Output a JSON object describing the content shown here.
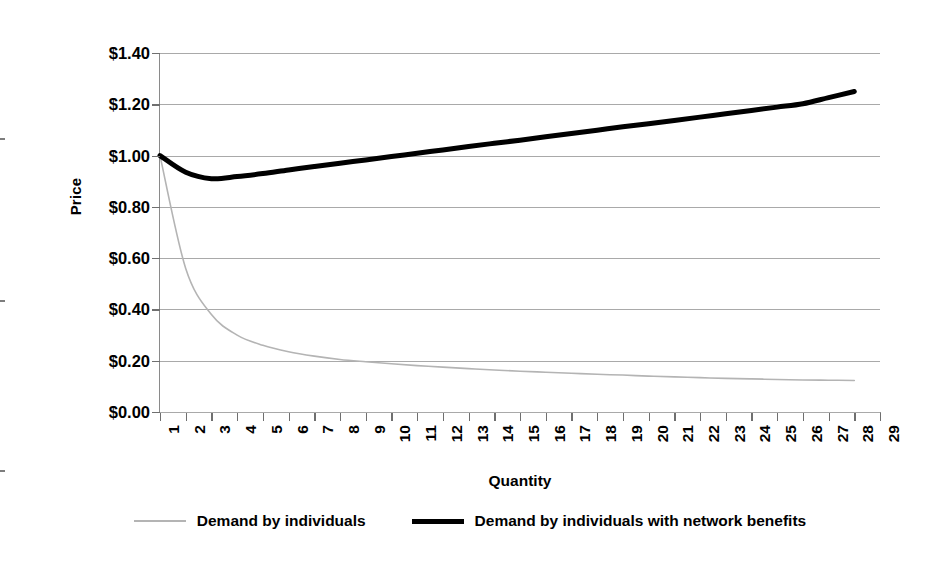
{
  "chart_data": {
    "type": "line",
    "title": "",
    "xlabel": "Quantity",
    "ylabel": "Price",
    "grid": true,
    "legend_position": "bottom",
    "xlim": [
      1,
      29
    ],
    "ylim": [
      0.0,
      1.4
    ],
    "y_ticks": [
      "$1.40",
      "$1.20",
      "$1.00",
      "$0.80",
      "$0.60",
      "$0.40",
      "$0.20",
      "$0.00"
    ],
    "y_tick_values": [
      1.4,
      1.2,
      1.0,
      0.8,
      0.6,
      0.4,
      0.2,
      0.0
    ],
    "x_ticks": [
      "1",
      "2",
      "3",
      "4",
      "5",
      "6",
      "7",
      "8",
      "9",
      "10",
      "11",
      "12",
      "13",
      "14",
      "15",
      "16",
      "17",
      "18",
      "19",
      "20",
      "21",
      "22",
      "23",
      "24",
      "25",
      "26",
      "27",
      "28",
      "29"
    ],
    "x": [
      1,
      2,
      3,
      4,
      5,
      6,
      7,
      8,
      9,
      10,
      11,
      12,
      13,
      14,
      15,
      16,
      17,
      18,
      19,
      20,
      21,
      22,
      23,
      24,
      25,
      26,
      27,
      28
    ],
    "series": [
      {
        "name": "Demand by individuals",
        "color": "#b4b4b4",
        "width": 1.6,
        "values": [
          1.0,
          0.56,
          0.38,
          0.3,
          0.26,
          0.235,
          0.218,
          0.205,
          0.196,
          0.188,
          0.181,
          0.175,
          0.169,
          0.164,
          0.159,
          0.155,
          0.151,
          0.147,
          0.144,
          0.14,
          0.137,
          0.134,
          0.131,
          0.129,
          0.127,
          0.125,
          0.124,
          0.123
        ]
      },
      {
        "name": "Demand by individuals with network benefits",
        "color": "#000000",
        "width": 5.0,
        "values": [
          1.0,
          0.935,
          0.91,
          0.918,
          0.93,
          0.944,
          0.957,
          0.97,
          0.983,
          0.996,
          1.009,
          1.022,
          1.035,
          1.048,
          1.06,
          1.073,
          1.086,
          1.099,
          1.112,
          1.124,
          1.137,
          1.15,
          1.163,
          1.176,
          1.189,
          1.202,
          1.226,
          1.25
        ]
      }
    ],
    "legend": [
      {
        "label": "Demand by individuals",
        "style": "thin-gray"
      },
      {
        "label": "Demand by individuals with network benefits",
        "style": "thick-black"
      }
    ]
  },
  "colors": {
    "gridline": "#a9a9a9",
    "axis": "#8a8a8a",
    "series_gray": "#b4b4b4",
    "series_black": "#000000",
    "background": "#ffffff"
  }
}
